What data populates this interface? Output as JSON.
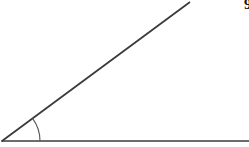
{
  "figure": {
    "kind": "geometry-angle-diagram",
    "background_color": "#ffffff",
    "stroke_color": "#3b3b3b",
    "arc_color": "#555555",
    "width": 249,
    "height": 147,
    "vertex": {
      "x": 2,
      "y": 141
    },
    "horizontal_ray": {
      "name": "horizontal-ray",
      "x1": 2,
      "y1": 141,
      "x2": 249,
      "y2": 141,
      "stroke_width": 1.6
    },
    "diagonal_ray": {
      "name": "diagonal-ray",
      "x1": 2,
      "y1": 141,
      "x2": 190,
      "y2": 2,
      "stroke_width": 1.8
    },
    "angle_arc": {
      "name": "angle-arc",
      "radius": 38,
      "start_x": 40,
      "start_y": 141,
      "end_x": 32,
      "end_y": 118,
      "measure_degrees": 36.5,
      "stroke_width": 1.1
    },
    "corner_mark": {
      "text": "9",
      "clipped": true
    }
  }
}
